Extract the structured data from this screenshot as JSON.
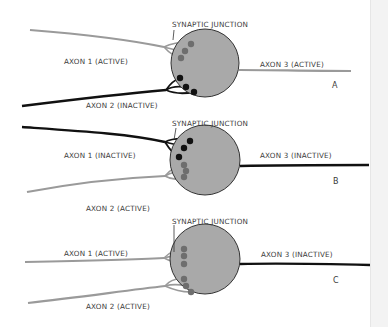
{
  "colors": {
    "active": "#9a9a9a",
    "inactive": "#111111",
    "cell_body": "#a9a9a9",
    "cell_outline": "#333333",
    "terminal_active": "#6e6e6e",
    "terminal_inactive": "#111111",
    "label": "#3a3a3a"
  },
  "panels": [
    {
      "id": "A",
      "junction_label": "SYNAPTIC JUNCTION",
      "axon1": {
        "label": "AXON 1 (ACTIVE)",
        "state": "active"
      },
      "axon2": {
        "label": "AXON 2 (INACTIVE)",
        "state": "inactive"
      },
      "axon3": {
        "label": "AXON 3 (ACTIVE)",
        "state": "active"
      }
    },
    {
      "id": "B",
      "junction_label": "SYNAPTIC JUNCTION",
      "axon1": {
        "label": "AXON 1 (INACTIVE)",
        "state": "inactive"
      },
      "axon2": {
        "label": "AXON 2 (ACTIVE)",
        "state": "active"
      },
      "axon3": {
        "label": "AXON 3 (INACTIVE)",
        "state": "inactive"
      }
    },
    {
      "id": "C",
      "junction_label": "SYNAPTIC JUNCTION",
      "axon1": {
        "label": "AXON 1 (ACTIVE)",
        "state": "active"
      },
      "axon2": {
        "label": "AXON 2 (ACTIVE)",
        "state": "active"
      },
      "axon3": {
        "label": "AXON 3 (INACTIVE)",
        "state": "inactive"
      }
    }
  ]
}
